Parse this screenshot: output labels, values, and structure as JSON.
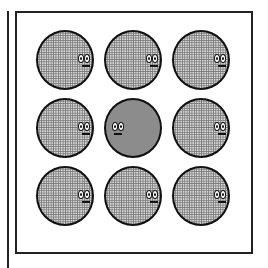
{
  "game": {
    "grid": {
      "rows": 3,
      "cols": 3
    },
    "selected_cell": 4,
    "cells": [
      {
        "row": 0,
        "col": 0,
        "state": "idle",
        "face": "right"
      },
      {
        "row": 0,
        "col": 1,
        "state": "idle",
        "face": "right"
      },
      {
        "row": 0,
        "col": 2,
        "state": "idle",
        "face": "right"
      },
      {
        "row": 1,
        "col": 0,
        "state": "idle",
        "face": "right"
      },
      {
        "row": 1,
        "col": 1,
        "state": "active",
        "face": "left"
      },
      {
        "row": 1,
        "col": 2,
        "state": "idle",
        "face": "right"
      },
      {
        "row": 2,
        "col": 0,
        "state": "idle",
        "face": "right"
      },
      {
        "row": 2,
        "col": 1,
        "state": "idle",
        "face": "right"
      },
      {
        "row": 2,
        "col": 2,
        "state": "idle",
        "face": "right"
      }
    ],
    "colors": {
      "idle_fill": "#d8d8d8",
      "active_fill": "#8c8c8c",
      "outline": "#111111"
    }
  }
}
